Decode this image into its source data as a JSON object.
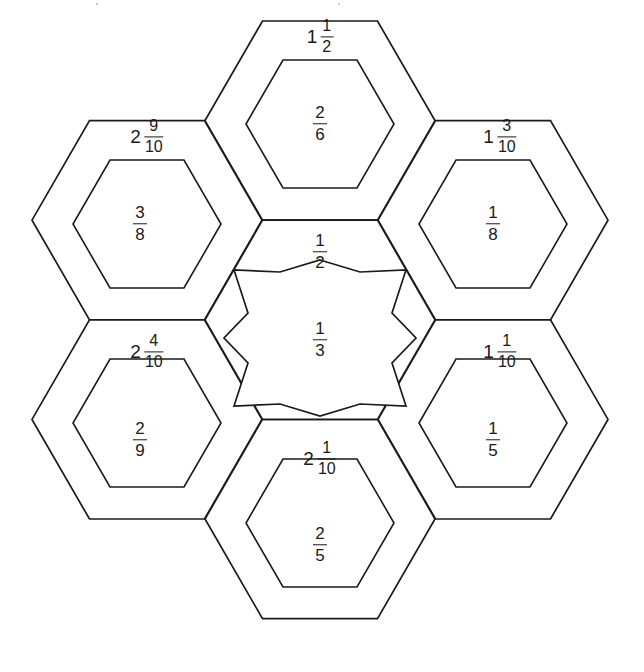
{
  "page": {
    "background_color": "#ffffff",
    "line_color": "#1a1a1a",
    "width": 644,
    "height": 672
  },
  "center": {
    "outer_label": "1/2",
    "outer_label_numerator": "1",
    "outer_label_denominator": "2",
    "star_label_numerator": "1",
    "star_label_denominator": "3",
    "star_points": 6
  },
  "petals": [
    {
      "position": "top",
      "outer_whole": "1",
      "outer_numerator": "1",
      "outer_denominator": "2",
      "inner_numerator": "2",
      "inner_denominator": "6"
    },
    {
      "position": "top-right",
      "outer_whole": "1",
      "outer_numerator": "3",
      "outer_denominator": "10",
      "inner_numerator": "1",
      "inner_denominator": "8"
    },
    {
      "position": "bottom-right",
      "outer_whole": "1",
      "outer_numerator": "1",
      "outer_denominator": "10",
      "inner_numerator": "1",
      "inner_denominator": "5"
    },
    {
      "position": "bottom",
      "outer_whole": "2",
      "outer_numerator": "1",
      "outer_denominator": "10",
      "inner_numerator": "2",
      "inner_denominator": "5"
    },
    {
      "position": "bottom-left",
      "outer_whole": "2",
      "outer_numerator": "4",
      "outer_denominator": "10",
      "inner_numerator": "2",
      "inner_denominator": "9"
    },
    {
      "position": "top-left",
      "outer_whole": "2",
      "outer_numerator": "9",
      "outer_denominator": "10",
      "inner_numerator": "3",
      "inner_denominator": "8"
    }
  ]
}
